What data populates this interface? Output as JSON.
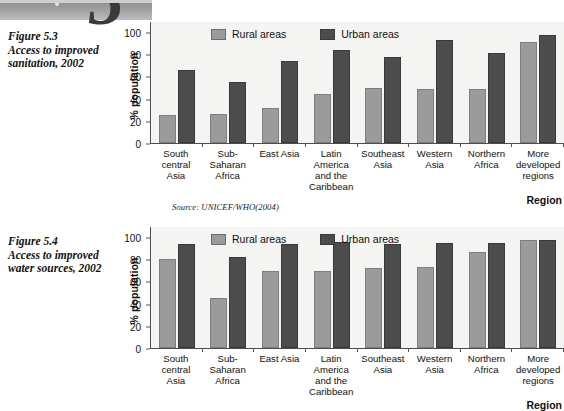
{
  "decoration": {
    "chapter_number": "5"
  },
  "figures": [
    {
      "caption_lines": [
        "Figure 5.3",
        "Access to improved",
        "sanitation, 2002"
      ],
      "source": "Source: UNICEF/WHO(2004)",
      "chart_data": {
        "type": "bar",
        "title": "Access to improved sanitation, 2002",
        "xlabel": "Region",
        "ylabel": "% population",
        "ylim": [
          0,
          110
        ],
        "yticks": [
          0,
          20,
          40,
          60,
          80,
          100
        ],
        "grid": false,
        "legend_position": "top-inside",
        "categories": [
          [
            "South",
            "central",
            "Asia"
          ],
          [
            "Sub-",
            "Saharan",
            "Africa"
          ],
          [
            "East Asia"
          ],
          [
            "Latin",
            "America",
            "and the",
            "Caribbean"
          ],
          [
            "Southeast",
            "Asia"
          ],
          [
            "Western",
            "Asia"
          ],
          [
            "Northern",
            "Africa"
          ],
          [
            "More",
            "developed",
            "regions"
          ]
        ],
        "series": [
          {
            "name": "Rural areas",
            "color": "#9b9b9b",
            "values": [
              25,
              26,
              32,
              44,
              50,
              49,
              49,
              91
            ]
          },
          {
            "name": "Urban areas",
            "color": "#4c4c4c",
            "values": [
              66,
              55,
              74,
              84,
              78,
              93,
              81,
              97
            ]
          }
        ]
      }
    },
    {
      "caption_lines": [
        "Figure 5.4",
        "Access to improved",
        "water sources, 2002"
      ],
      "source": "",
      "chart_data": {
        "type": "bar",
        "title": "Access to improved water sources, 2002",
        "xlabel": "Region",
        "ylabel": "% population",
        "ylim": [
          0,
          110
        ],
        "yticks": [
          0,
          20,
          40,
          60,
          80,
          100
        ],
        "grid": false,
        "legend_position": "top-inside",
        "categories": [
          [
            "South",
            "central",
            "Asia"
          ],
          [
            "Sub-",
            "Saharan",
            "Africa"
          ],
          [
            "East Asia"
          ],
          [
            "Latin",
            "America",
            "and the",
            "Caribbean"
          ],
          [
            "Southeast",
            "Asia"
          ],
          [
            "Western",
            "Asia"
          ],
          [
            "Northern",
            "Africa"
          ],
          [
            "More",
            "developed",
            "regions"
          ]
        ],
        "series": [
          {
            "name": "Rural areas",
            "color": "#9b9b9b",
            "values": [
              80,
              45,
              69,
              69,
              72,
              73,
              87,
              97
            ]
          },
          {
            "name": "Urban areas",
            "color": "#4c4c4c",
            "values": [
              94,
              82,
              94,
              96,
              94,
              95,
              95,
              97
            ]
          }
        ]
      }
    }
  ]
}
